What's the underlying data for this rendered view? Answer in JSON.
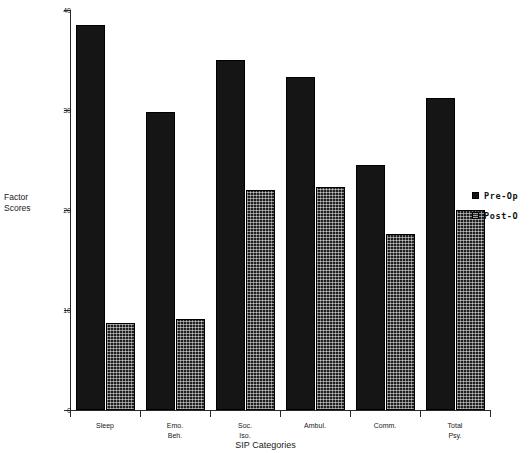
{
  "chart_data": {
    "type": "bar",
    "title": "",
    "xlabel": "SIP Categories",
    "ylabel": "Factor\nScores",
    "categories": [
      "Sleep",
      "Emo.\nBeh.",
      "Soc.\nIso.",
      "Ambul.",
      "Comm.",
      "Total\nPsy."
    ],
    "series": [
      {
        "name": "Pre-Op",
        "values": [
          38.5,
          29.8,
          35.0,
          33.3,
          24.5,
          31.2
        ],
        "color": "#151515",
        "fill": "solid"
      },
      {
        "name": "Post-Op",
        "values": [
          8.7,
          9.1,
          22.0,
          22.3,
          17.6,
          20.0
        ],
        "color": "#1f1f1f",
        "fill": "hatched"
      }
    ],
    "ylim": [
      0,
      40
    ],
    "yticks": [
      0,
      10,
      20,
      30,
      40
    ],
    "ytick_labels": [
      "0",
      "10",
      "20",
      "30",
      "40"
    ],
    "grid": false,
    "legend_position": "right",
    "legend_entries": [
      "Pre-Op",
      "Post-O"
    ]
  },
  "axes": {
    "y_label": "Factor\nScores",
    "x_label": "SIP Categories"
  }
}
